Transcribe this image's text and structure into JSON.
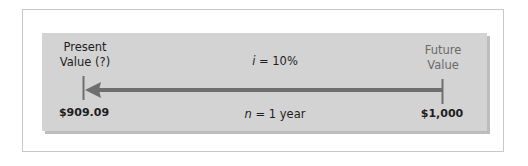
{
  "diagram": {
    "present": {
      "label_line1": "Present",
      "label_line2": "Value (?)",
      "amount": "$909.09"
    },
    "future": {
      "label_line1": "Future",
      "label_line2": "Value",
      "amount": "$1,000"
    },
    "rate": {
      "var": "i",
      "text": " = 10%"
    },
    "period": {
      "var": "n",
      "text": " = 1 year"
    },
    "arrow_direction": "right-to-left",
    "colors": {
      "panel": "#d3d3d3",
      "panel_shadow": "#bdbdbd",
      "arrow": "#6e6e6e",
      "frame_border": "#c8c8c8",
      "text": "#1e1e1e",
      "muted_text": "#6a6a6a"
    }
  }
}
